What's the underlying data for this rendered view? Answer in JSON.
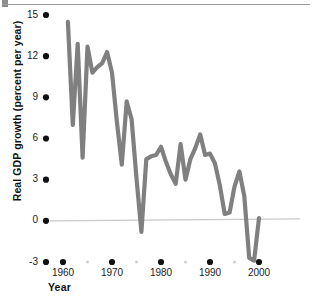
{
  "chart_data": {
    "type": "line",
    "title": "",
    "xlabel": "Year",
    "ylabel": "Real GDP growth (percent per year)",
    "xlim": [
      1959,
      2001
    ],
    "ylim": [
      -3,
      15
    ],
    "yticks": [
      15,
      12,
      9,
      6,
      3,
      0,
      -3
    ],
    "ytick_labels": [
      "15",
      "12",
      "9",
      "6",
      "3",
      "0",
      "-3"
    ],
    "xticks": [
      1960,
      1970,
      1980,
      1990,
      2000
    ],
    "xtick_labels": [
      "1960",
      "1970",
      "1980",
      "1990",
      "2000"
    ],
    "xminor_ticks": [
      1965,
      1975,
      1985,
      1995
    ],
    "grid": false,
    "legend": null,
    "zero_line": 0,
    "line_color": "#808080",
    "tick_color": "#111111",
    "zero_line_color": "#c9c9c9",
    "series": [
      {
        "name": "Real GDP growth",
        "x": [
          1961,
          1962,
          1963,
          1964,
          1965,
          1966,
          1967,
          1968,
          1969,
          1970,
          1971,
          1972,
          1973,
          1974,
          1975,
          1976,
          1977,
          1978,
          1979,
          1980,
          1981,
          1982,
          1983,
          1984,
          1985,
          1986,
          1987,
          1988,
          1989,
          1990,
          1991,
          1992,
          1993,
          1994,
          1995,
          1996,
          1997,
          1998,
          1999,
          2000
        ],
        "values": [
          14.5,
          7.0,
          12.9,
          4.6,
          12.7,
          10.8,
          11.2,
          11.5,
          12.3,
          10.8,
          7.2,
          4.1,
          8.7,
          7.4,
          3.1,
          -0.8,
          4.5,
          4.7,
          4.8,
          5.4,
          4.3,
          3.4,
          2.7,
          5.6,
          3.0,
          4.5,
          5.3,
          6.3,
          4.8,
          4.9,
          4.2,
          2.6,
          0.5,
          0.6,
          2.5,
          3.6,
          1.8,
          -2.7,
          -2.9,
          0.2
        ]
      }
    ]
  },
  "axis": {
    "y_title": "Real GDP growth (percent per year)",
    "x_title": "Year"
  }
}
